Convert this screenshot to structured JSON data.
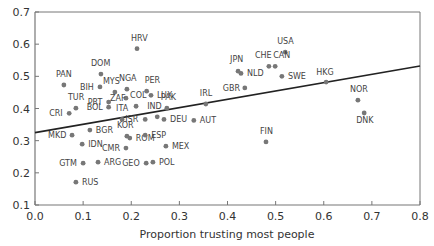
{
  "chart_data": {
    "type": "scatter",
    "title": "",
    "xlabel": "Proportion trusting most people",
    "ylabel": "",
    "xlim": [
      0.0,
      0.8
    ],
    "ylim": [
      0.1,
      0.7
    ],
    "xticks": [
      "0.0",
      "0.1",
      "0.2",
      "0.3",
      "0.4",
      "0.5",
      "0.6",
      "0.7",
      "0.8"
    ],
    "yticks": [
      "0.1",
      "0.2",
      "0.3",
      "0.4",
      "0.5",
      "0.6",
      "0.7"
    ],
    "grid": false,
    "legend": null,
    "trendline": {
      "x": [
        0.0,
        0.8
      ],
      "y": [
        0.325,
        0.532
      ]
    },
    "points": [
      {
        "label": "HRV",
        "x": 0.212,
        "y": 0.586,
        "lx": -6,
        "ly": -8
      },
      {
        "label": "USA",
        "x": 0.52,
        "y": 0.575,
        "lx": -8,
        "ly": -8
      },
      {
        "label": "CHE",
        "x": 0.486,
        "y": 0.531,
        "lx": -14,
        "ly": -8
      },
      {
        "label": "CAN",
        "x": 0.499,
        "y": 0.531,
        "lx": -2,
        "ly": -8
      },
      {
        "label": "JPN",
        "x": 0.422,
        "y": 0.516,
        "lx": -8,
        "ly": -9
      },
      {
        "label": "NLD",
        "x": 0.428,
        "y": 0.509,
        "lx": 6,
        "ly": 3
      },
      {
        "label": "SWE",
        "x": 0.513,
        "y": 0.5,
        "lx": 6,
        "ly": 3
      },
      {
        "label": "DOM",
        "x": 0.137,
        "y": 0.507,
        "lx": -10,
        "ly": -8
      },
      {
        "label": "HKG",
        "x": 0.605,
        "y": 0.482,
        "lx": -10,
        "ly": -7
      },
      {
        "label": "PAN",
        "x": 0.06,
        "y": 0.473,
        "lx": -8,
        "ly": -8
      },
      {
        "label": "BIH",
        "x": 0.135,
        "y": 0.467,
        "lx": -20,
        "ly": 3
      },
      {
        "label": "GBR",
        "x": 0.436,
        "y": 0.464,
        "lx": -22,
        "ly": 3
      },
      {
        "label": "NGA",
        "x": 0.191,
        "y": 0.46,
        "lx": -8,
        "ly": -8
      },
      {
        "label": "MYS",
        "x": 0.166,
        "y": 0.451,
        "lx": -12,
        "ly": -8
      },
      {
        "label": "PER",
        "x": 0.232,
        "y": 0.454,
        "lx": -2,
        "ly": -8
      },
      {
        "label": "LUX",
        "x": 0.241,
        "y": 0.441,
        "lx": 6,
        "ly": 3
      },
      {
        "label": "NOR",
        "x": 0.671,
        "y": 0.426,
        "lx": -8,
        "ly": -8
      },
      {
        "label": "ZAF",
        "x": 0.189,
        "y": 0.432,
        "lx": -16,
        "ly": 3
      },
      {
        "label": "PRT",
        "x": 0.153,
        "y": 0.42,
        "lx": -21,
        "ly": 3
      },
      {
        "label": "COL",
        "x": 0.21,
        "y": 0.407,
        "lx": -6,
        "ly": -8
      },
      {
        "label": "IRL",
        "x": 0.355,
        "y": 0.414,
        "lx": -6,
        "ly": -8
      },
      {
        "label": "TUR",
        "x": 0.085,
        "y": 0.401,
        "lx": -8,
        "ly": -8
      },
      {
        "label": "BOL",
        "x": 0.153,
        "y": 0.404,
        "lx": -22,
        "ly": 3
      },
      {
        "label": "PAK",
        "x": 0.274,
        "y": 0.401,
        "lx": -6,
        "ly": -8
      },
      {
        "label": "DNK",
        "x": 0.684,
        "y": 0.386,
        "lx": -8,
        "ly": 10
      },
      {
        "label": "CRI",
        "x": 0.071,
        "y": 0.385,
        "lx": -20,
        "ly": 3
      },
      {
        "label": "IND",
        "x": 0.254,
        "y": 0.374,
        "lx": -10,
        "ly": -8
      },
      {
        "label": "ITA",
        "x": 0.181,
        "y": 0.366,
        "lx": -6,
        "ly": -8
      },
      {
        "label": "ISR",
        "x": 0.229,
        "y": 0.366,
        "lx": -20,
        "ly": 3
      },
      {
        "label": "DEU",
        "x": 0.268,
        "y": 0.366,
        "lx": 6,
        "ly": 3
      },
      {
        "label": "AUT",
        "x": 0.33,
        "y": 0.363,
        "lx": 6,
        "ly": 3
      },
      {
        "label": "MKD",
        "x": 0.077,
        "y": 0.317,
        "lx": -24,
        "ly": 3
      },
      {
        "label": "BGR",
        "x": 0.114,
        "y": 0.333,
        "lx": 6,
        "ly": 3
      },
      {
        "label": "KOR",
        "x": 0.191,
        "y": 0.314,
        "lx": -10,
        "ly": -8
      },
      {
        "label": "ROM",
        "x": 0.197,
        "y": 0.308,
        "lx": 6,
        "ly": 3
      },
      {
        "label": "ESP",
        "x": 0.229,
        "y": 0.317,
        "lx": 6,
        "ly": 3
      },
      {
        "label": "IDN",
        "x": 0.098,
        "y": 0.289,
        "lx": 6,
        "ly": 3
      },
      {
        "label": "CMR",
        "x": 0.189,
        "y": 0.277,
        "lx": -24,
        "ly": 3
      },
      {
        "label": "MEX",
        "x": 0.272,
        "y": 0.283,
        "lx": 6,
        "ly": 3
      },
      {
        "label": "GTM",
        "x": 0.1,
        "y": 0.23,
        "lx": -24,
        "ly": 3
      },
      {
        "label": "ARG",
        "x": 0.131,
        "y": 0.233,
        "lx": 6,
        "ly": 3
      },
      {
        "label": "GEO",
        "x": 0.231,
        "y": 0.23,
        "lx": -24,
        "ly": 3
      },
      {
        "label": "POL",
        "x": 0.245,
        "y": 0.233,
        "lx": 6,
        "ly": 3
      },
      {
        "label": "RUS",
        "x": 0.085,
        "y": 0.171,
        "lx": 6,
        "ly": 3
      },
      {
        "label": "FIN",
        "x": 0.48,
        "y": 0.296,
        "lx": -6,
        "ly": -8
      }
    ]
  }
}
